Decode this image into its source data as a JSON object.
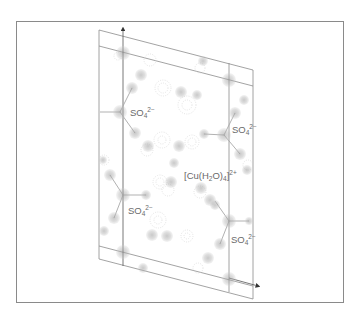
{
  "figure": {
    "frame_color": "#8a8a8a",
    "cell_line_color": "#8c8c8c",
    "atom_color": "#b8b8b8",
    "contour_color": "#cfcfcf"
  },
  "axes": {
    "vertical_axis": {
      "arrow": true
    },
    "horizontal_axis": {
      "arrow": true
    }
  },
  "labels": [
    {
      "id": "sulfate-top-left",
      "base": "SO",
      "sub": "4",
      "sup": "2−"
    },
    {
      "id": "sulfate-top-right",
      "base": "SO",
      "sub": "4",
      "sup": "2−"
    },
    {
      "id": "copper-complex",
      "prefix": "[Cu(H",
      "sub1": "2",
      "middle": "O)",
      "sub2": "4",
      "suffix": "]",
      "sup": "2+"
    },
    {
      "id": "sulfate-bottom-left",
      "base": "SO",
      "sub": "4",
      "sup": "2−"
    },
    {
      "id": "sulfate-bottom-right",
      "base": "SO",
      "sub": "4",
      "sup": "2−"
    }
  ]
}
